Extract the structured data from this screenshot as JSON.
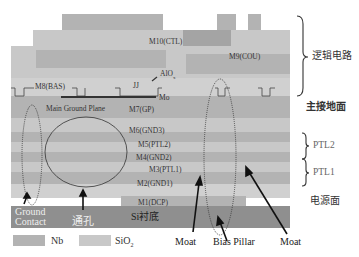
{
  "diagram": {
    "title": "",
    "layers": [
      {
        "id": "M10",
        "label": "M10(CTL)"
      },
      {
        "id": "M9",
        "label": "M9(COU)"
      },
      {
        "id": "M8",
        "label": "M8(BAS)"
      },
      {
        "id": "JJ",
        "label": "JJ"
      },
      {
        "id": "AlOx",
        "label": "AlOx"
      },
      {
        "id": "Mo",
        "label": "Mo"
      },
      {
        "id": "MGP",
        "label": "Main Ground Plane"
      },
      {
        "id": "M7",
        "label": "M7(GP)"
      },
      {
        "id": "M6",
        "label": "M6(GND3)"
      },
      {
        "id": "M5",
        "label": "M5(PTL2)"
      },
      {
        "id": "M4",
        "label": "M4(GND2)"
      },
      {
        "id": "M3",
        "label": "M3(PTL1)"
      },
      {
        "id": "M2",
        "label": "M2(GND1)"
      },
      {
        "id": "M1",
        "label": "M1(DCP)"
      },
      {
        "id": "Si",
        "label": "Si衬底"
      }
    ],
    "side_labels": {
      "logic": "逻辑电路",
      "main_ground": "主接地面",
      "ptl2": "PTL2",
      "ptl1": "PTL1",
      "power": "电源面"
    },
    "annotations": {
      "ground_contact_line1": "Ground",
      "ground_contact_line2": "Contact",
      "via": "通孔",
      "moat_left": "Moat",
      "bias_pillar": "Bias Pillar",
      "moat_right": "Moat"
    },
    "legend": [
      {
        "label": "Nb",
        "color": "#b3b3b3"
      },
      {
        "label": "SiO2",
        "color": "#c8c8c8"
      }
    ],
    "colors": {
      "nb": "#b3b3b3",
      "sio2": "#c8c8c8",
      "substrate": "#8f8f8f",
      "mo_line": "#333333"
    }
  }
}
